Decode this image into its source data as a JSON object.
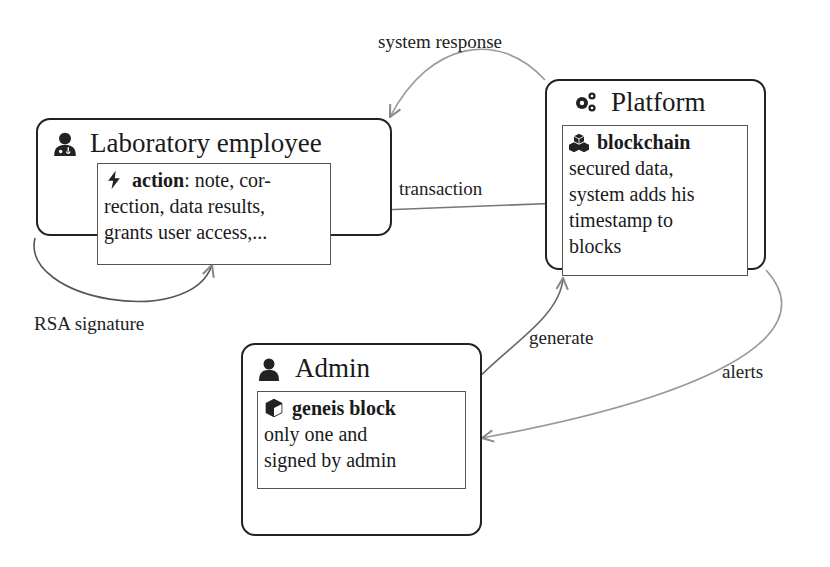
{
  "nodes": {
    "employee": {
      "title": "Laboratory employee",
      "icon": "user-doctor-icon",
      "inner": {
        "icon": "bolt-icon",
        "heading": "action",
        "heading_suffix": ": note, cor-",
        "lines": [
          "rection, data results,",
          "grants user access,..."
        ]
      }
    },
    "platform": {
      "title": "Platform",
      "icon": "cogs-icon",
      "inner": {
        "icon": "cubes-icon",
        "heading": "blockchain",
        "lines": [
          "secured data,",
          "system adds his",
          "timestamp to",
          "blocks"
        ]
      }
    },
    "admin": {
      "title": "Admin",
      "icon": "user-icon",
      "inner": {
        "icon": "cube-icon",
        "heading": "geneis block",
        "lines": [
          "only one and",
          "signed by admin"
        ]
      }
    }
  },
  "edges": [
    {
      "from": "platform",
      "to": "employee",
      "label": "system response"
    },
    {
      "from": "employee",
      "to": "platform",
      "label": "transaction"
    },
    {
      "from": "employee",
      "to": "employee",
      "label": "RSA signature"
    },
    {
      "from": "admin",
      "to": "platform",
      "label": "generate"
    },
    {
      "from": "platform",
      "to": "admin",
      "label": "alerts"
    }
  ],
  "colors": {
    "node_border": "#222222",
    "inner_border": "#555555",
    "edge": "#888888",
    "text": "#1a1a1a"
  }
}
